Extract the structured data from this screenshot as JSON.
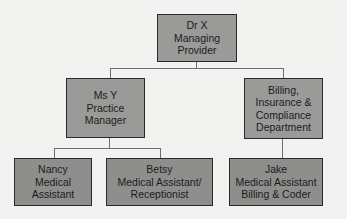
{
  "chart": {
    "nodes": [
      {
        "id": "dr-x",
        "lines": [
          "Dr X",
          "Managing",
          "Provider"
        ],
        "level": 0,
        "parent": null
      },
      {
        "id": "ms-y",
        "lines": [
          "Ms Y",
          "Practice",
          "Manager"
        ],
        "level": 1,
        "parent": "dr-x"
      },
      {
        "id": "billing",
        "lines": [
          "Billing,",
          "Insurance &",
          "Compliance",
          "Department"
        ],
        "level": 1,
        "parent": "dr-x"
      },
      {
        "id": "nancy",
        "lines": [
          "Nancy",
          "Medical",
          "Assistant"
        ],
        "level": 2,
        "parent": "ms-y"
      },
      {
        "id": "betsy",
        "lines": [
          "Betsy",
          "Medical Assistant/",
          "Receptionist"
        ],
        "level": 2,
        "parent": "ms-y"
      },
      {
        "id": "jake",
        "lines": [
          "Jake",
          "Medical Assistant",
          "Billing & Coder"
        ],
        "level": 2,
        "parent": "billing"
      }
    ],
    "colors": {
      "box_fill": "#8e8e8c",
      "box_border": "#2a2a2a",
      "connector": "#6e6e6e",
      "background": "#f2f2f0"
    }
  }
}
